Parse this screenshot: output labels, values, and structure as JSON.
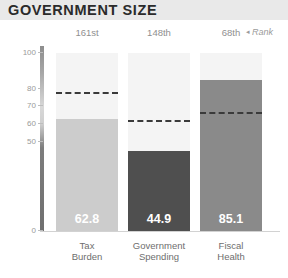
{
  "header": {
    "title": "GOVERNMENT SIZE"
  },
  "rank_legend": {
    "caret": "◂",
    "label": "Rank"
  },
  "axis": {
    "ticks": [
      "100",
      "80",
      "70",
      "60",
      "50",
      "0"
    ]
  },
  "chart_data": {
    "type": "bar",
    "title": "GOVERNMENT SIZE",
    "xlabel": "",
    "ylabel": "",
    "ylim": [
      0,
      100
    ],
    "grid": false,
    "legend": "Rank",
    "categories": [
      "Tax Burden",
      "Government Spending",
      "Fiscal Health"
    ],
    "values": [
      62.8,
      44.9,
      85.1
    ],
    "value_labels": [
      "62.8",
      "44.9",
      "85.1"
    ],
    "ranks": [
      "161st",
      "148th",
      "68th"
    ],
    "benchmarks": [
      77.0,
      61.0,
      65.5
    ],
    "bar_colors": [
      "#cccccc",
      "#4f4f4f",
      "#8a8a8a"
    ],
    "track_color": "#f4f4f4",
    "benchmark_color": "#3a3a3a",
    "axis_tick_labels": [
      "100",
      "80",
      "70",
      "60",
      "50",
      "0"
    ],
    "axis_tick_values": [
      100,
      80,
      70,
      60,
      50,
      0
    ]
  },
  "series": [
    {
      "category": "Tax Burden",
      "category_line1": "Tax",
      "category_line2": "Burden",
      "rank": "161st",
      "value": "62.8",
      "benchmark": 77.0,
      "color": "#cccccc"
    },
    {
      "category": "Government Spending",
      "category_line1": "Government",
      "category_line2": "Spending",
      "rank": "148th",
      "value": "44.9",
      "benchmark": 61.0,
      "color": "#4f4f4f"
    },
    {
      "category": "Fiscal Health",
      "category_line1": "Fiscal",
      "category_line2": "Health",
      "rank": "68th",
      "value": "85.1",
      "benchmark": 65.5,
      "color": "#8a8a8a"
    }
  ]
}
